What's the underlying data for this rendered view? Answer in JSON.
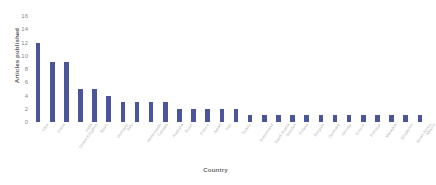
{
  "chart_data": {
    "type": "bar",
    "title": "",
    "subtitle": "",
    "xlabel": "Country",
    "ylabel": "Articles published",
    "grid": false,
    "legend": false,
    "ylim": [
      0,
      16
    ],
    "yticks": [
      16,
      14,
      12,
      10,
      8,
      6,
      4,
      2,
      0
    ],
    "categories": [
      "USA",
      "China",
      "United Kingdom",
      "India",
      "Spain",
      "Germany",
      "Italy",
      "Netherlands",
      "Canada",
      "Australia",
      "Brazil",
      "France",
      "Japan",
      "Iran",
      "Turkey",
      "Switzerland",
      "Saudi Arabia",
      "Sweden",
      "Poland",
      "Belgium",
      "Denmark",
      "Norway",
      "Greece",
      "Portugal",
      "Malaysia",
      "Singapore",
      "South Korea",
      "Mexico"
    ],
    "values": [
      12,
      9,
      9,
      5,
      5,
      4,
      3,
      3,
      3,
      3,
      2,
      2,
      2,
      2,
      2,
      1,
      1,
      1,
      1,
      1,
      1,
      1,
      1,
      1,
      1,
      1,
      1,
      1
    ],
    "series_color": "#4a5699",
    "background_color": "#ffffff",
    "tick_label_color": "#b6b6b6",
    "axis_title_color": "#6b6b6b"
  }
}
